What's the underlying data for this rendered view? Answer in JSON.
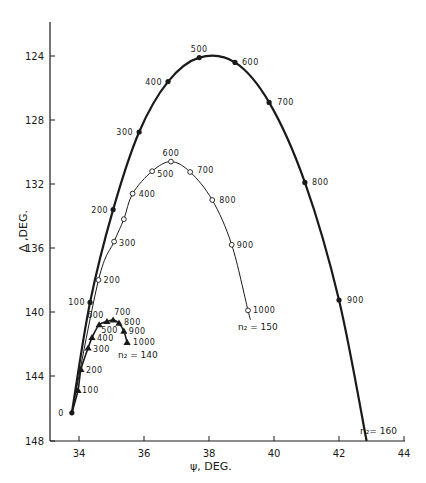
{
  "chart_data": {
    "type": "line",
    "title": "",
    "xlabel": "ψ, DEG.",
    "ylabel": "Δ ,DEG.",
    "xlim": [
      33.1,
      44
    ],
    "ylim": [
      148,
      122
    ],
    "y_inverted": true,
    "x_ticks": [
      34,
      36,
      38,
      40,
      42,
      44
    ],
    "y_ticks": [
      124,
      128,
      132,
      136,
      140,
      144,
      148
    ],
    "grid": false,
    "legend": "none (series labelled inline)",
    "series": [
      {
        "name": "n2 = 160",
        "label_text": "n₂= 160",
        "marker": "filled-circle",
        "line_weight": "heavy",
        "points": [
          {
            "label": "0",
            "x": 33.78,
            "y": 146.3
          },
          {
            "label": "100",
            "x": 34.34,
            "y": 139.4
          },
          {
            "label": "200",
            "x": 35.05,
            "y": 133.6
          },
          {
            "label": "300",
            "x": 35.85,
            "y": 128.75
          },
          {
            "label": "400",
            "x": 36.74,
            "y": 125.6
          },
          {
            "label": "500",
            "x": 37.7,
            "y": 124.1
          },
          {
            "label": "600",
            "x": 38.8,
            "y": 124.4
          },
          {
            "label": "700",
            "x": 39.85,
            "y": 126.9
          },
          {
            "label": "800",
            "x": 40.95,
            "y": 131.9
          },
          {
            "label": "900",
            "x": 42.0,
            "y": 139.25
          }
        ],
        "curve_end": {
          "x": 42.85,
          "y": 148
        }
      },
      {
        "name": "n2 = 150",
        "label_text": "n₂ = 150",
        "marker": "open-circle",
        "line_weight": "thin",
        "points": [
          {
            "label": "0",
            "x": 33.78,
            "y": 146.3
          },
          {
            "label": "200",
            "x": 34.6,
            "y": 138.0
          },
          {
            "label": "300",
            "x": 35.08,
            "y": 135.6
          },
          {
            "label": "",
            "x": 35.38,
            "y": 134.2
          },
          {
            "label": "400",
            "x": 35.65,
            "y": 132.6
          },
          {
            "label": "500",
            "x": 36.25,
            "y": 131.2
          },
          {
            "label": "600",
            "x": 36.83,
            "y": 130.6
          },
          {
            "label": "700",
            "x": 37.42,
            "y": 131.25
          },
          {
            "label": "800",
            "x": 38.1,
            "y": 133.0
          },
          {
            "label": "900",
            "x": 38.7,
            "y": 135.8
          },
          {
            "label": "1000",
            "x": 39.2,
            "y": 139.9
          }
        ],
        "curve_end": {
          "x": 39.28,
          "y": 140.5
        }
      },
      {
        "name": "n2 = 140",
        "label_text": "n₂ = 140",
        "marker": "filled-triangle",
        "line_weight": "medium",
        "points": [
          {
            "label": "0",
            "x": 33.78,
            "y": 146.3
          },
          {
            "label": "100",
            "x": 33.97,
            "y": 144.9
          },
          {
            "label": "200",
            "x": 34.06,
            "y": 143.6
          },
          {
            "label": "300",
            "x": 34.28,
            "y": 142.25
          },
          {
            "label": "400",
            "x": 34.4,
            "y": 141.6
          },
          {
            "label": "500",
            "x": 34.62,
            "y": 140.8
          },
          {
            "label": "600",
            "x": 34.86,
            "y": 140.6
          },
          {
            "label": "700",
            "x": 35.05,
            "y": 140.5
          },
          {
            "label": "800",
            "x": 35.23,
            "y": 140.7
          },
          {
            "label": "900",
            "x": 35.38,
            "y": 141.2
          },
          {
            "label": "1000",
            "x": 35.48,
            "y": 141.9
          }
        ]
      }
    ]
  },
  "axes": {
    "x_label": "ψ, DEG.",
    "y_label": "Δ ,DEG.",
    "x_tick_labels": [
      "34",
      "36",
      "38",
      "40",
      "42",
      "44"
    ],
    "y_tick_labels": [
      "124",
      "128",
      "132",
      "136",
      "140",
      "144",
      "148"
    ]
  },
  "series_labels": {
    "n160": "n₂= 160",
    "n150": "n₂ = 150",
    "n140": "n₂ = 140"
  },
  "style": {
    "ink": "#1a1a1a",
    "background": "#ffffff"
  }
}
